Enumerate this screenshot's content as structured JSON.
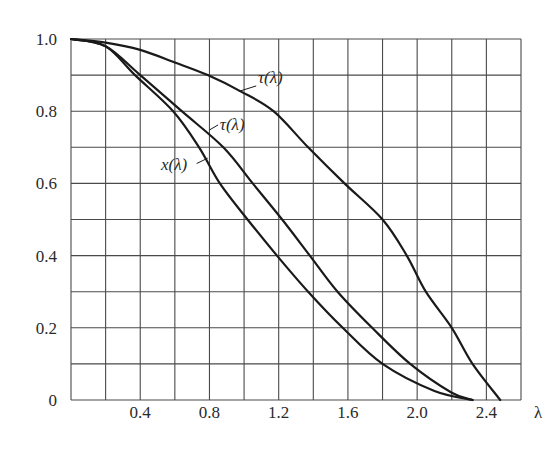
{
  "chart_data": {
    "type": "line",
    "title": "",
    "xlabel": "λ",
    "ylabel": "",
    "xlim": [
      0,
      2.6
    ],
    "ylim": [
      0,
      1.0
    ],
    "grid": true,
    "x_grid_step": 0.2,
    "y_grid_step": 0.1,
    "x_ticks": [
      {
        "value": 0.4,
        "label": "0.4"
      },
      {
        "value": 0.8,
        "label": "0.8"
      },
      {
        "value": 1.2,
        "label": "1.2"
      },
      {
        "value": 1.6,
        "label": "1.6"
      },
      {
        "value": 2.0,
        "label": "2.0"
      },
      {
        "value": 2.4,
        "label": "2.4"
      }
    ],
    "y_ticks": [
      {
        "value": 0,
        "label": "0"
      },
      {
        "value": 0.2,
        "label": "0.2"
      },
      {
        "value": 0.4,
        "label": "0.4"
      },
      {
        "value": 0.6,
        "label": "0.6"
      },
      {
        "value": 0.8,
        "label": "0.8"
      },
      {
        "value": 1.0,
        "label": "1.0"
      }
    ],
    "series": [
      {
        "name": "τ(λ) (upper)",
        "label": "τ(λ)",
        "label_pos": [
          1.08,
          0.895
        ],
        "leader": [
          [
            1.07,
            0.87
          ],
          [
            0.97,
            0.855
          ]
        ],
        "points": [
          [
            0,
            1.0
          ],
          [
            0.2,
            0.99
          ],
          [
            0.4,
            0.97
          ],
          [
            0.6,
            0.935
          ],
          [
            0.79,
            0.9
          ],
          [
            0.98,
            0.855
          ],
          [
            1.17,
            0.8
          ],
          [
            1.37,
            0.7
          ],
          [
            1.58,
            0.6
          ],
          [
            1.8,
            0.5
          ],
          [
            1.94,
            0.4
          ],
          [
            2.05,
            0.3
          ],
          [
            2.2,
            0.2
          ],
          [
            2.32,
            0.1
          ],
          [
            2.48,
            0.0
          ]
        ]
      },
      {
        "name": "τ(λ) (middle)",
        "label": "τ(λ)",
        "label_pos": [
          0.86,
          0.765
        ],
        "leader": [
          [
            0.85,
            0.762
          ],
          [
            0.8,
            0.748
          ]
        ],
        "points": [
          [
            0,
            1.0
          ],
          [
            0.2,
            0.98
          ],
          [
            0.4,
            0.9
          ],
          [
            0.64,
            0.8
          ],
          [
            0.88,
            0.7
          ],
          [
            1.05,
            0.6
          ],
          [
            1.22,
            0.5
          ],
          [
            1.38,
            0.4
          ],
          [
            1.54,
            0.3
          ],
          [
            1.74,
            0.2
          ],
          [
            1.96,
            0.1
          ],
          [
            2.2,
            0.02
          ],
          [
            2.32,
            0.0
          ]
        ]
      },
      {
        "name": "x(λ)",
        "label": "x(λ)",
        "label_pos": [
          0.52,
          0.655
        ],
        "leader": [
          [
            0.726,
            0.655
          ],
          [
            0.79,
            0.67
          ]
        ],
        "points": [
          [
            0,
            1.0
          ],
          [
            0.2,
            0.98
          ],
          [
            0.37,
            0.9
          ],
          [
            0.59,
            0.8
          ],
          [
            0.74,
            0.7
          ],
          [
            0.86,
            0.6
          ],
          [
            1.02,
            0.5
          ],
          [
            1.19,
            0.4
          ],
          [
            1.37,
            0.3
          ],
          [
            1.57,
            0.2
          ],
          [
            1.8,
            0.1
          ],
          [
            2.1,
            0.025
          ],
          [
            2.32,
            0.0
          ]
        ]
      }
    ]
  },
  "axis": {
    "lambda_label": "λ"
  }
}
